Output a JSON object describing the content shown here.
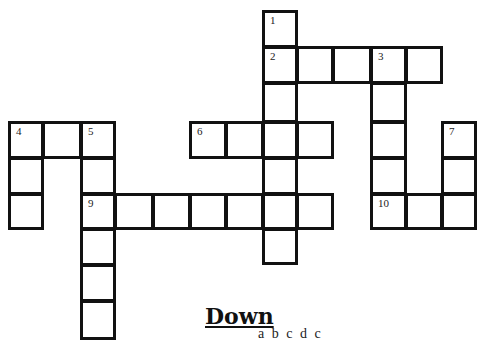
{
  "puzzle": {
    "heading_down": "Down",
    "clue_partial": "a   b   c   d   c"
  },
  "cells": [
    {
      "x": 262,
      "y": 10,
      "w": 36,
      "h": 38,
      "num": "1"
    },
    {
      "x": 262,
      "y": 46,
      "w": 36,
      "h": 38,
      "num": "2"
    },
    {
      "x": 296,
      "y": 46,
      "w": 38,
      "h": 38,
      "num": ""
    },
    {
      "x": 332,
      "y": 46,
      "w": 40,
      "h": 38,
      "num": ""
    },
    {
      "x": 370,
      "y": 46,
      "w": 37,
      "h": 38,
      "num": "3"
    },
    {
      "x": 405,
      "y": 46,
      "w": 38,
      "h": 38,
      "num": ""
    },
    {
      "x": 262,
      "y": 82,
      "w": 36,
      "h": 41,
      "num": ""
    },
    {
      "x": 370,
      "y": 82,
      "w": 37,
      "h": 41,
      "num": ""
    },
    {
      "x": 8,
      "y": 121,
      "w": 36,
      "h": 38,
      "num": "4"
    },
    {
      "x": 42,
      "y": 121,
      "w": 40,
      "h": 38,
      "num": ""
    },
    {
      "x": 80,
      "y": 121,
      "w": 36,
      "h": 38,
      "num": "5"
    },
    {
      "x": 189,
      "y": 121,
      "w": 38,
      "h": 38,
      "num": "6"
    },
    {
      "x": 225,
      "y": 121,
      "w": 39,
      "h": 38,
      "num": ""
    },
    {
      "x": 262,
      "y": 121,
      "w": 36,
      "h": 38,
      "num": ""
    },
    {
      "x": 296,
      "y": 121,
      "w": 38,
      "h": 38,
      "num": ""
    },
    {
      "x": 370,
      "y": 121,
      "w": 37,
      "h": 38,
      "num": ""
    },
    {
      "x": 441,
      "y": 121,
      "w": 36,
      "h": 38,
      "num": "7"
    },
    {
      "x": 8,
      "y": 157,
      "w": 36,
      "h": 38,
      "num": ""
    },
    {
      "x": 80,
      "y": 157,
      "w": 36,
      "h": 38,
      "num": ""
    },
    {
      "x": 262,
      "y": 157,
      "w": 36,
      "h": 38,
      "num": ""
    },
    {
      "x": 370,
      "y": 157,
      "w": 37,
      "h": 38,
      "num": ""
    },
    {
      "x": 441,
      "y": 157,
      "w": 36,
      "h": 38,
      "num": ""
    },
    {
      "x": 8,
      "y": 193,
      "w": 36,
      "h": 37,
      "num": ""
    },
    {
      "x": 80,
      "y": 193,
      "w": 36,
      "h": 37,
      "num": "9"
    },
    {
      "x": 114,
      "y": 193,
      "w": 40,
      "h": 37,
      "num": ""
    },
    {
      "x": 152,
      "y": 193,
      "w": 39,
      "h": 37,
      "num": ""
    },
    {
      "x": 189,
      "y": 193,
      "w": 38,
      "h": 37,
      "num": ""
    },
    {
      "x": 225,
      "y": 193,
      "w": 39,
      "h": 37,
      "num": ""
    },
    {
      "x": 262,
      "y": 193,
      "w": 36,
      "h": 37,
      "num": ""
    },
    {
      "x": 296,
      "y": 193,
      "w": 38,
      "h": 37,
      "num": ""
    },
    {
      "x": 370,
      "y": 193,
      "w": 37,
      "h": 37,
      "num": "10"
    },
    {
      "x": 405,
      "y": 193,
      "w": 38,
      "h": 37,
      "num": ""
    },
    {
      "x": 441,
      "y": 193,
      "w": 36,
      "h": 37,
      "num": ""
    },
    {
      "x": 262,
      "y": 228,
      "w": 36,
      "h": 37,
      "num": ""
    },
    {
      "x": 80,
      "y": 228,
      "w": 36,
      "h": 38,
      "num": ""
    },
    {
      "x": 80,
      "y": 264,
      "w": 36,
      "h": 38,
      "num": ""
    },
    {
      "x": 80,
      "y": 300,
      "w": 36,
      "h": 40,
      "num": ""
    }
  ]
}
